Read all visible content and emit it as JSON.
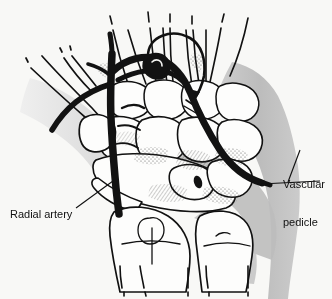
{
  "figure": {
    "background_color": "#f8f8f6",
    "ink_color": "#111111",
    "shade_color": "#b8b8b8",
    "bone_fill": "#fdfdfc",
    "vessel_color": "#121212"
  },
  "labels": {
    "radial_artery": "Radial artery",
    "vascular_pedicle_line1": "Vascular",
    "vascular_pedicle_line2": "pedicle"
  },
  "annotations": {
    "rotation_arrow": "curved-rotation-arrow",
    "nutrient_foramen": "dark-oval-foramen"
  },
  "structures": {
    "vessel_name": "radial-artery-vessel",
    "pedicle_name": "vascular-pedicle-branch",
    "carpal_group": "carpal-bones",
    "metacarpal_group": "metacarpal-shafts",
    "forearm_group": "radius-and-ulna",
    "thumb_group": "thumb-first-metacarpal",
    "soft_tissue": "soft-tissue-shading"
  }
}
